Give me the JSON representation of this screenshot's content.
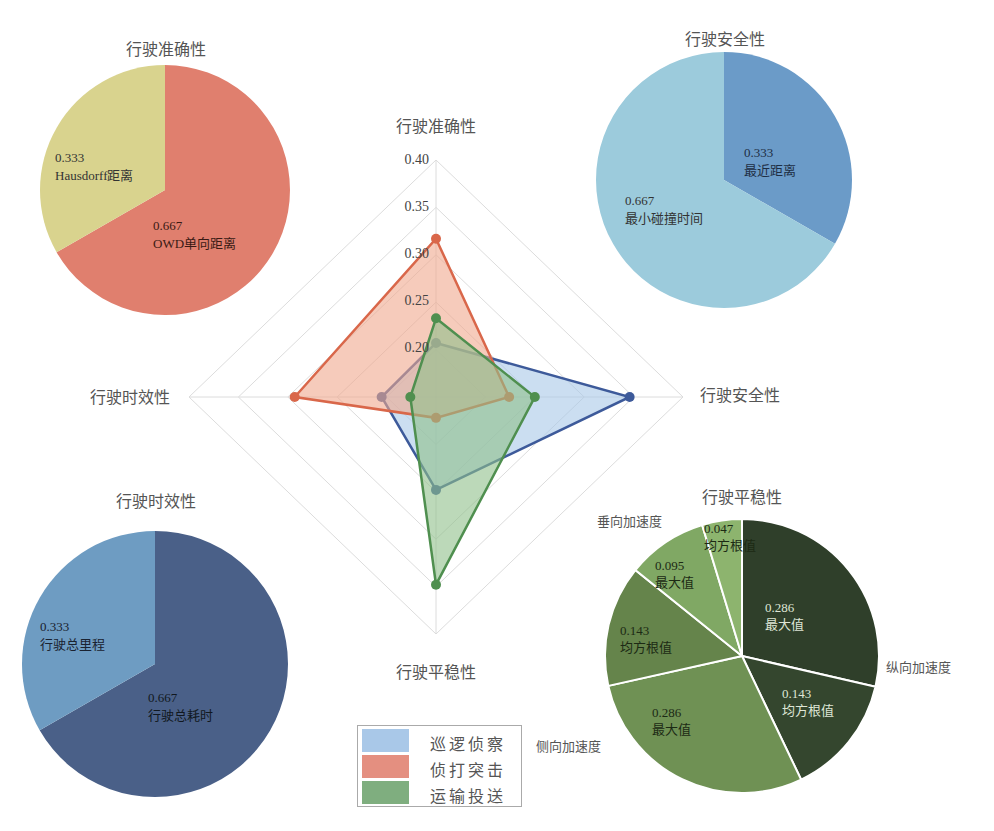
{
  "chart_data": [
    {
      "type": "radar",
      "title": "",
      "axes": [
        "行驶准确性",
        "行驶安全性",
        "行驶平稳性",
        "行驶时效性"
      ],
      "rlim": [
        0.15,
        0.4
      ],
      "ticks": [
        "0.20",
        "0.25",
        "0.30",
        "0.35",
        "0.40"
      ],
      "grid": true,
      "legend_position": "bottom-center",
      "series": [
        {
          "name": "巡逻侦察",
          "color": "#3d5a9a",
          "fill": "#a9c8e8",
          "values": [
            0.207,
            0.346,
            0.248,
            0.205
          ]
        },
        {
          "name": "侦打突击",
          "color": "#d9674a",
          "fill": "#f0a88e",
          "values": [
            0.317,
            0.224,
            0.172,
            0.293
          ]
        },
        {
          "name": "运输投送",
          "color": "#4f8f4f",
          "fill": "#8fbf8a",
          "values": [
            0.233,
            0.25,
            0.348,
            0.176
          ]
        }
      ]
    },
    {
      "type": "pie",
      "title": "行驶准确性",
      "slices": [
        {
          "label": "OWD单向距离",
          "value": 0.667,
          "text": "0.667",
          "color": "#e07f6e"
        },
        {
          "label": "Hausdorff距离",
          "value": 0.333,
          "text": "0.333",
          "color": "#d9d38e"
        }
      ]
    },
    {
      "type": "pie",
      "title": "行驶安全性",
      "slices": [
        {
          "label": "最近距离",
          "value": 0.333,
          "text": "0.333",
          "color": "#6b9bc8"
        },
        {
          "label": "最小碰撞时间",
          "value": 0.667,
          "text": "0.667",
          "color": "#9ccbdc"
        }
      ]
    },
    {
      "type": "pie",
      "title": "行驶时效性",
      "slices": [
        {
          "label": "行驶总耗时",
          "value": 0.667,
          "text": "0.667",
          "color": "#4a6088"
        },
        {
          "label": "行驶总里程",
          "value": 0.333,
          "text": "0.333",
          "color": "#6e9cc2"
        }
      ]
    },
    {
      "type": "pie",
      "title": "行驶平稳性",
      "groups": [
        "纵向加速度",
        "侧向加速度",
        "垂向加速度"
      ],
      "slices": [
        {
          "label": "最大值",
          "group": "纵向加速度",
          "value": 0.286,
          "text": "0.286",
          "color": "#2f3f2a"
        },
        {
          "label": "均方根值",
          "group": "纵向加速度",
          "value": 0.143,
          "text": "0.143",
          "color": "#34462e"
        },
        {
          "label": "最大值",
          "group": "侧向加速度",
          "value": 0.286,
          "text": "0.286",
          "color": "#6f9154"
        },
        {
          "label": "均方根值",
          "group": "侧向加速度",
          "value": 0.143,
          "text": "0.143",
          "color": "#65844b"
        },
        {
          "label": "最大值",
          "group": "垂向加速度",
          "value": 0.095,
          "text": "0.095",
          "color": "#80a864"
        },
        {
          "label": "均方根值",
          "group": "垂向加速度",
          "value": 0.047,
          "text": "0.047",
          "color": "#8db46e"
        }
      ]
    }
  ],
  "legend": {
    "items": [
      {
        "label": "巡逻侦察",
        "color": "#a9c8e8"
      },
      {
        "label": "侦打突击",
        "color": "#e48f80"
      },
      {
        "label": "运输投送",
        "color": "#7fae7f"
      }
    ]
  }
}
